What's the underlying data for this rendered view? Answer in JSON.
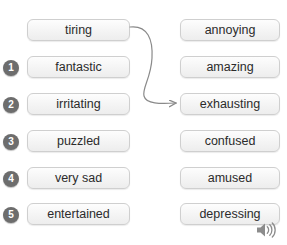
{
  "exercise": {
    "title": "Matching exercise",
    "left_column": {
      "name": "adjectives-column-left",
      "items": [
        {
          "number": "",
          "label": "tiring",
          "is_example": true,
          "matched": true
        },
        {
          "number": "1",
          "label": "fantastic",
          "is_example": false,
          "matched": false
        },
        {
          "number": "2",
          "label": "irritating",
          "is_example": false,
          "matched": false
        },
        {
          "number": "3",
          "label": "puzzled",
          "is_example": false,
          "matched": false
        },
        {
          "number": "4",
          "label": "very sad",
          "is_example": false,
          "matched": false
        },
        {
          "number": "5",
          "label": "entertained",
          "is_example": false,
          "matched": false
        }
      ]
    },
    "right_column": {
      "name": "adjectives-column-right",
      "items": [
        {
          "label": "annoying"
        },
        {
          "label": "amazing"
        },
        {
          "label": "exhausting"
        },
        {
          "label": "confused"
        },
        {
          "label": "amused"
        },
        {
          "label": "depressing"
        }
      ]
    },
    "connection": {
      "from": "tiring",
      "to": "exhausting",
      "style": "curved-arrow"
    },
    "audio": {
      "icon": "speaker-icon",
      "label": "Play audio"
    },
    "colors": {
      "badge_fill": "#6d6d6d",
      "badge_text": "#ffffff",
      "chip_border": "#cfcfcf",
      "chip_text": "#2b2b2b",
      "arrow": "#8a8a8a",
      "speaker": "#8c8c8c",
      "background": "#ffffff"
    }
  }
}
